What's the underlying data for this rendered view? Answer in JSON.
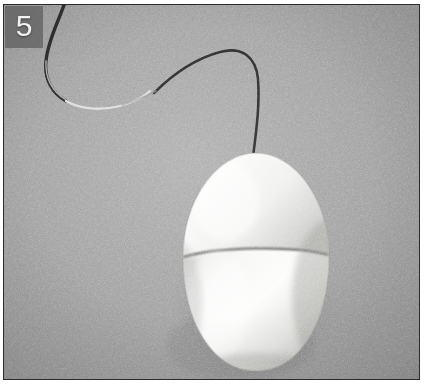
{
  "image": {
    "kind": "photograph",
    "subject": "computer-mouse",
    "description": "Grayscale photograph of an egg-shaped computer mouse with a thin cable on a textured gray surface",
    "width_px": 424,
    "height_px": 388,
    "border_color": "#2b2b2b",
    "background_color": "#9d9d9d"
  },
  "overlay": {
    "index_label": "5",
    "badge_color": "#5c5c5c",
    "label_color": "#f2f2f2"
  },
  "subject": {
    "mouse": {
      "name": "egg-shaped-mouse",
      "body_color": "#f1f1ef",
      "shadow_color": "#6f6f6f",
      "seam_color": "#4a4a4a",
      "center_x_px": 252,
      "center_y_px": 262,
      "width_px": 152,
      "height_px": 215
    },
    "cable": {
      "name": "mouse-cable",
      "dark_color": "#2e2e2e",
      "light_color": "#d8d8d8",
      "thickness_px": 2
    }
  }
}
